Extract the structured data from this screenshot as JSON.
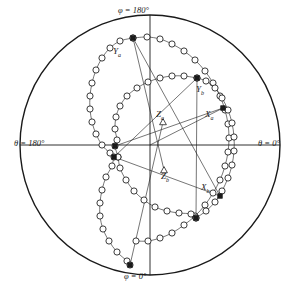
{
  "figure": {
    "name": "stereographic-projection",
    "width": 301,
    "height": 290,
    "background": "#ffffff",
    "ink": "#1a1a1a"
  },
  "axis_labels": {
    "top": {
      "text": "φ = 180°",
      "x": 118,
      "y": 6
    },
    "bottom": {
      "text": "φ = 0°",
      "x": 124,
      "y": 272
    },
    "left": {
      "text": "θ = 180°",
      "x": 14,
      "y": 139
    },
    "right": {
      "text": "θ = 0°",
      "x": 258,
      "y": 139
    }
  },
  "pole_labels": [
    {
      "id": "Ya",
      "base": "Y",
      "sub": "a",
      "x": 113,
      "y": 47
    },
    {
      "id": "Yb",
      "base": "Y",
      "sub": "b",
      "x": 196,
      "y": 85
    },
    {
      "id": "Za",
      "base": "Z",
      "sub": "a",
      "x": 156,
      "y": 110
    },
    {
      "id": "Xa",
      "base": "X",
      "sub": "a",
      "x": 205,
      "y": 110
    },
    {
      "id": "Zb",
      "base": "Z",
      "sub": "b",
      "x": 161,
      "y": 172
    },
    {
      "id": "Xb",
      "base": "X",
      "sub": "b",
      "x": 201,
      "y": 183
    }
  ],
  "chart_data": {
    "type": "scatter",
    "title": "",
    "projection": "stereographic (equal-angle) pole figure",
    "primitive_circle": {
      "cx": 150,
      "cy": 145,
      "r": 130
    },
    "reference_lines": [
      {
        "name": "horizontal-diameter",
        "x1": 20,
        "y1": 145,
        "x2": 280,
        "y2": 145
      },
      {
        "name": "vertical-diameter",
        "x1": 150,
        "y1": 15,
        "x2": 150,
        "y2": 275
      }
    ],
    "poles": [
      {
        "label": "Ya",
        "marker": "filled-square",
        "x": 133,
        "y": 38
      },
      {
        "label": "Yb",
        "marker": "filled-square",
        "x": 197,
        "y": 78
      },
      {
        "label": "Za",
        "marker": "open-triangle",
        "x": 163,
        "y": 122
      },
      {
        "label": "Xa",
        "marker": "filled-square",
        "x": 223,
        "y": 108
      },
      {
        "label": "Zb",
        "marker": "open-triangle",
        "x": 164,
        "y": 170
      },
      {
        "label": "Xb",
        "marker": "filled-square",
        "x": 220,
        "y": 196
      },
      {
        "label": "pole-left-upper",
        "marker": "filled-square",
        "x": 115,
        "y": 146
      },
      {
        "label": "pole-left-lower",
        "marker": "filled-square",
        "x": 114,
        "y": 157
      },
      {
        "label": "pole-bottom-a",
        "marker": "filled-square",
        "x": 130,
        "y": 265
      },
      {
        "label": "pole-bottom-b",
        "marker": "filled-square",
        "x": 196,
        "y": 218
      }
    ],
    "great_circles": [
      {
        "name": "great-circle-a-outer",
        "marker": "open-circle",
        "points": [
          [
            133,
            38
          ],
          [
            120,
            41
          ],
          [
            110,
            48
          ],
          [
            102,
            58
          ],
          [
            96,
            70
          ],
          [
            92,
            83
          ],
          [
            90,
            96
          ],
          [
            90,
            109
          ],
          [
            92,
            122
          ],
          [
            96,
            134
          ],
          [
            102,
            145
          ],
          [
            110,
            153
          ],
          [
            118,
            157
          ],
          [
            114,
            157
          ],
          [
            112,
            166
          ],
          [
            106,
            177
          ],
          [
            102,
            190
          ],
          [
            100,
            203
          ],
          [
            100,
            216
          ],
          [
            103,
            229
          ],
          [
            109,
            241
          ],
          [
            117,
            252
          ],
          [
            127,
            261
          ],
          [
            130,
            265
          ]
        ]
      },
      {
        "name": "great-circle-a-right",
        "marker": "open-circle",
        "points": [
          [
            133,
            38
          ],
          [
            147,
            37
          ],
          [
            160,
            39
          ],
          [
            172,
            44
          ],
          [
            184,
            51
          ],
          [
            195,
            60
          ],
          [
            205,
            71
          ],
          [
            213,
            83
          ],
          [
            220,
            96
          ],
          [
            225,
            110
          ],
          [
            228,
            124
          ],
          [
            229,
            138
          ],
          [
            228,
            152
          ],
          [
            225,
            166
          ],
          [
            220,
            180
          ],
          [
            213,
            193
          ],
          [
            205,
            205
          ],
          [
            195,
            216
          ],
          [
            184,
            225
          ],
          [
            172,
            233
          ],
          [
            160,
            238
          ],
          [
            148,
            241
          ],
          [
            136,
            241
          ]
        ]
      },
      {
        "name": "great-circle-b-inner",
        "marker": "open-circle",
        "points": [
          [
            197,
            78
          ],
          [
            184,
            76
          ],
          [
            172,
            76
          ],
          [
            160,
            78
          ],
          [
            148,
            82
          ],
          [
            137,
            88
          ],
          [
            127,
            96
          ],
          [
            120,
            106
          ],
          [
            116,
            117
          ],
          [
            115,
            129
          ],
          [
            117,
            140
          ],
          [
            115,
            146
          ],
          [
            118,
            157
          ],
          [
            120,
            168
          ],
          [
            126,
            180
          ],
          [
            134,
            191
          ],
          [
            144,
            200
          ],
          [
            155,
            207
          ],
          [
            167,
            211
          ],
          [
            179,
            213
          ],
          [
            191,
            214
          ],
          [
            196,
            218
          ]
        ]
      },
      {
        "name": "great-circle-b-lower",
        "marker": "open-circle",
        "points": [
          [
            196,
            218
          ],
          [
            206,
            211
          ],
          [
            215,
            202
          ],
          [
            222,
            191
          ],
          [
            228,
            178
          ],
          [
            232,
            165
          ],
          [
            234,
            151
          ],
          [
            234,
            137
          ],
          [
            232,
            123
          ],
          [
            228,
            110
          ],
          [
            222,
            98
          ],
          [
            215,
            88
          ],
          [
            206,
            81
          ],
          [
            197,
            78
          ]
        ]
      }
    ],
    "construction_lines": [
      {
        "name": "Ya-to-Zb",
        "x1": 133,
        "y1": 38,
        "x2": 164,
        "y2": 170
      },
      {
        "name": "Ya-to-Xb",
        "x1": 133,
        "y1": 38,
        "x2": 220,
        "y2": 196
      },
      {
        "name": "Za-to-bottom",
        "x1": 163,
        "y1": 122,
        "x2": 130,
        "y2": 265
      },
      {
        "name": "left-to-Xa",
        "x1": 115,
        "y1": 146,
        "x2": 223,
        "y2": 108
      },
      {
        "name": "left-to-Xb",
        "x1": 114,
        "y1": 157,
        "x2": 220,
        "y2": 196
      },
      {
        "name": "left-to-Yb",
        "x1": 114,
        "y1": 157,
        "x2": 197,
        "y2": 78
      },
      {
        "name": "Yb-to-bottomb",
        "x1": 197,
        "y1": 78,
        "x2": 196,
        "y2": 218
      },
      {
        "name": "Xa-to-center-lower",
        "x1": 223,
        "y1": 108,
        "x2": 150,
        "y2": 145
      }
    ]
  }
}
